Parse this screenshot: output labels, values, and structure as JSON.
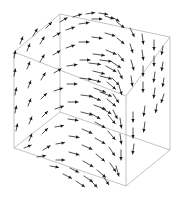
{
  "figure": {
    "title": "",
    "background_color": "#ffffff",
    "arrow_color": "#1a1a1a",
    "box_color": "#9a9a9a"
  },
  "chart_data": {
    "type": "scatter",
    "subtype": "quiver-3d-vector-field",
    "title": "",
    "subtitle": "",
    "xlabel": "",
    "ylabel": "",
    "zlabel": "",
    "grid": false,
    "legend": null,
    "legend_position": "none",
    "axis_ticks_visible": false,
    "tick_labels": [],
    "annotations": [],
    "xlim": [
      -1,
      1
    ],
    "ylim": [
      -1,
      1
    ],
    "zlim": [
      -1,
      1
    ],
    "field_description": "3D divergent (source-like) vector field; arrows radiate outward from a focus located right-of-center, sweeping around toward the box faces",
    "singularity_screen_xy": [
      126,
      96
    ],
    "grid_dims": [
      7,
      7,
      7
    ],
    "bounding_box_projection": {
      "front_top_left": [
        14,
        52
      ],
      "front_top_right": [
        126,
        96
      ],
      "front_bottom_left": [
        14,
        148
      ],
      "front_bottom_right": [
        126,
        186
      ],
      "back_top_left": [
        60,
        14
      ],
      "back_top_right": [
        170,
        37
      ],
      "back_bottom_left": [
        60,
        112
      ],
      "back_bottom_right": [
        170,
        150
      ]
    },
    "arrows": [
      {
        "x": 14,
        "y": 58,
        "dx": 1,
        "dy": -5
      },
      {
        "x": 14,
        "y": 76,
        "dx": 1,
        "dy": -5
      },
      {
        "x": 15,
        "y": 95,
        "dx": 1,
        "dy": -5
      },
      {
        "x": 15,
        "y": 113,
        "dx": 1,
        "dy": -5
      },
      {
        "x": 16,
        "y": 131,
        "dx": 1,
        "dy": -5
      },
      {
        "x": 27,
        "y": 51,
        "dx": 2,
        "dy": -5
      },
      {
        "x": 27,
        "y": 69,
        "dx": 2,
        "dy": -5
      },
      {
        "x": 28,
        "y": 88,
        "dx": 2,
        "dy": -5
      },
      {
        "x": 28,
        "y": 106,
        "dx": 2,
        "dy": -5
      },
      {
        "x": 29,
        "y": 124,
        "dx": 2,
        "dy": -5
      },
      {
        "x": 29,
        "y": 141,
        "dx": 2,
        "dy": -5
      },
      {
        "x": 40,
        "y": 44,
        "dx": 3,
        "dy": -5
      },
      {
        "x": 40,
        "y": 62,
        "dx": 3,
        "dy": -5
      },
      {
        "x": 41,
        "y": 80,
        "dx": 3,
        "dy": -5
      },
      {
        "x": 41,
        "y": 99,
        "dx": 4,
        "dy": -4
      },
      {
        "x": 42,
        "y": 117,
        "dx": 4,
        "dy": -4
      },
      {
        "x": 42,
        "y": 134,
        "dx": 4,
        "dy": -4
      },
      {
        "x": 43,
        "y": 150,
        "dx": 5,
        "dy": -3
      },
      {
        "x": 53,
        "y": 37,
        "dx": 5,
        "dy": -3
      },
      {
        "x": 53,
        "y": 55,
        "dx": 5,
        "dy": -3
      },
      {
        "x": 54,
        "y": 73,
        "dx": 5,
        "dy": -3
      },
      {
        "x": 54,
        "y": 91,
        "dx": 6,
        "dy": -2
      },
      {
        "x": 55,
        "y": 109,
        "dx": 6,
        "dy": -2
      },
      {
        "x": 55,
        "y": 127,
        "dx": 6,
        "dy": -1
      },
      {
        "x": 56,
        "y": 144,
        "dx": 6,
        "dy": -1
      },
      {
        "x": 56,
        "y": 160,
        "dx": 6,
        "dy": 0
      },
      {
        "x": 66,
        "y": 30,
        "dx": 6,
        "dy": -2
      },
      {
        "x": 66,
        "y": 48,
        "dx": 6,
        "dy": -2
      },
      {
        "x": 67,
        "y": 66,
        "dx": 7,
        "dy": -1
      },
      {
        "x": 67,
        "y": 84,
        "dx": 7,
        "dy": 0
      },
      {
        "x": 68,
        "y": 102,
        "dx": 7,
        "dy": 0
      },
      {
        "x": 68,
        "y": 119,
        "dx": 7,
        "dy": 1
      },
      {
        "x": 69,
        "y": 136,
        "dx": 7,
        "dy": 1
      },
      {
        "x": 69,
        "y": 152,
        "dx": 7,
        "dy": 2
      },
      {
        "x": 70,
        "y": 168,
        "dx": 6,
        "dy": 3
      },
      {
        "x": 79,
        "y": 24,
        "dx": 7,
        "dy": -1
      },
      {
        "x": 79,
        "y": 42,
        "dx": 7,
        "dy": 0
      },
      {
        "x": 80,
        "y": 60,
        "dx": 7,
        "dy": 0
      },
      {
        "x": 80,
        "y": 78,
        "dx": 8,
        "dy": 1
      },
      {
        "x": 81,
        "y": 95,
        "dx": 8,
        "dy": 1
      },
      {
        "x": 81,
        "y": 112,
        "dx": 8,
        "dy": 2
      },
      {
        "x": 82,
        "y": 129,
        "dx": 7,
        "dy": 3
      },
      {
        "x": 82,
        "y": 145,
        "dx": 7,
        "dy": 3
      },
      {
        "x": 83,
        "y": 161,
        "dx": 7,
        "dy": 4
      },
      {
        "x": 84,
        "y": 176,
        "dx": 6,
        "dy": 4
      },
      {
        "x": 92,
        "y": 19,
        "dx": 7,
        "dy": 0
      },
      {
        "x": 92,
        "y": 37,
        "dx": 7,
        "dy": 1
      },
      {
        "x": 93,
        "y": 54,
        "dx": 8,
        "dy": 1
      },
      {
        "x": 93,
        "y": 71,
        "dx": 8,
        "dy": 2
      },
      {
        "x": 94,
        "y": 88,
        "dx": 8,
        "dy": 3
      },
      {
        "x": 94,
        "y": 105,
        "dx": 8,
        "dy": 3
      },
      {
        "x": 95,
        "y": 122,
        "dx": 7,
        "dy": 4
      },
      {
        "x": 95,
        "y": 138,
        "dx": 7,
        "dy": 4
      },
      {
        "x": 96,
        "y": 154,
        "dx": 6,
        "dy": 5
      },
      {
        "x": 97,
        "y": 170,
        "dx": 6,
        "dy": 5
      },
      {
        "x": 105,
        "y": 16,
        "dx": 6,
        "dy": 2
      },
      {
        "x": 105,
        "y": 33,
        "dx": 7,
        "dy": 2
      },
      {
        "x": 106,
        "y": 50,
        "dx": 7,
        "dy": 3
      },
      {
        "x": 106,
        "y": 66,
        "dx": 7,
        "dy": 4
      },
      {
        "x": 107,
        "y": 82,
        "dx": 6,
        "dy": 5
      },
      {
        "x": 107,
        "y": 99,
        "dx": 6,
        "dy": 5
      },
      {
        "x": 108,
        "y": 115,
        "dx": 5,
        "dy": 6
      },
      {
        "x": 108,
        "y": 131,
        "dx": 5,
        "dy": 6
      },
      {
        "x": 109,
        "y": 147,
        "dx": 4,
        "dy": 6
      },
      {
        "x": 110,
        "y": 163,
        "dx": 4,
        "dy": 6
      },
      {
        "x": 117,
        "y": 22,
        "dx": 5,
        "dy": 4
      },
      {
        "x": 117,
        "y": 38,
        "dx": 5,
        "dy": 4
      },
      {
        "x": 118,
        "y": 54,
        "dx": 4,
        "dy": 5
      },
      {
        "x": 118,
        "y": 70,
        "dx": 3,
        "dy": 6
      },
      {
        "x": 119,
        "y": 86,
        "dx": 2,
        "dy": 6
      },
      {
        "x": 120,
        "y": 118,
        "dx": 1,
        "dy": 7
      },
      {
        "x": 120,
        "y": 134,
        "dx": 1,
        "dy": 7
      },
      {
        "x": 121,
        "y": 150,
        "dx": 0,
        "dy": 7
      },
      {
        "x": 130,
        "y": 28,
        "dx": 3,
        "dy": 6
      },
      {
        "x": 130,
        "y": 44,
        "dx": 2,
        "dy": 6
      },
      {
        "x": 131,
        "y": 60,
        "dx": 2,
        "dy": 7
      },
      {
        "x": 131,
        "y": 76,
        "dx": 1,
        "dy": 7
      },
      {
        "x": 133,
        "y": 112,
        "dx": 0,
        "dy": 7
      },
      {
        "x": 133,
        "y": 128,
        "dx": 0,
        "dy": 7
      },
      {
        "x": 134,
        "y": 144,
        "dx": -1,
        "dy": 7
      },
      {
        "x": 142,
        "y": 34,
        "dx": 1,
        "dy": 7
      },
      {
        "x": 142,
        "y": 50,
        "dx": 1,
        "dy": 7
      },
      {
        "x": 143,
        "y": 66,
        "dx": 0,
        "dy": 7
      },
      {
        "x": 143,
        "y": 82,
        "dx": 0,
        "dy": 7
      },
      {
        "x": 145,
        "y": 106,
        "dx": -1,
        "dy": 7
      },
      {
        "x": 145,
        "y": 122,
        "dx": -1,
        "dy": 7
      },
      {
        "x": 154,
        "y": 40,
        "dx": 0,
        "dy": 7
      },
      {
        "x": 154,
        "y": 56,
        "dx": 0,
        "dy": 7
      },
      {
        "x": 155,
        "y": 72,
        "dx": -1,
        "dy": 7
      },
      {
        "x": 155,
        "y": 88,
        "dx": -1,
        "dy": 7
      },
      {
        "x": 157,
        "y": 104,
        "dx": -1,
        "dy": 6
      },
      {
        "x": 163,
        "y": 46,
        "dx": -1,
        "dy": 6
      },
      {
        "x": 163,
        "y": 62,
        "dx": -1,
        "dy": 6
      },
      {
        "x": 164,
        "y": 78,
        "dx": -1,
        "dy": 6
      },
      {
        "x": 164,
        "y": 94,
        "dx": -2,
        "dy": 6
      },
      {
        "x": 46,
        "y": 28,
        "dx": 4,
        "dy": -4
      },
      {
        "x": 60,
        "y": 22,
        "dx": 5,
        "dy": -3
      },
      {
        "x": 73,
        "y": 17,
        "dx": 6,
        "dy": -2
      },
      {
        "x": 86,
        "y": 14,
        "dx": 6,
        "dy": -1
      },
      {
        "x": 99,
        "y": 13,
        "dx": 6,
        "dy": 1
      },
      {
        "x": 112,
        "y": 17,
        "dx": 5,
        "dy": 3
      },
      {
        "x": 33,
        "y": 36,
        "dx": 3,
        "dy": -5
      },
      {
        "x": 20,
        "y": 44,
        "dx": 2,
        "dy": -5
      },
      {
        "x": 24,
        "y": 148,
        "dx": 5,
        "dy": -2
      },
      {
        "x": 37,
        "y": 157,
        "dx": 6,
        "dy": -1
      },
      {
        "x": 50,
        "y": 166,
        "dx": 6,
        "dy": 1
      },
      {
        "x": 63,
        "y": 174,
        "dx": 6,
        "dy": 3
      },
      {
        "x": 76,
        "y": 181,
        "dx": 6,
        "dy": 4
      },
      {
        "x": 90,
        "y": 180,
        "dx": 5,
        "dy": 5
      },
      {
        "x": 103,
        "y": 176,
        "dx": 4,
        "dy": 6
      },
      {
        "x": 116,
        "y": 166,
        "dx": 2,
        "dy": 7
      },
      {
        "x": 100,
        "y": 60,
        "dx": 8,
        "dy": 1
      },
      {
        "x": 100,
        "y": 76,
        "dx": 8,
        "dy": 2
      },
      {
        "x": 100,
        "y": 92,
        "dx": 8,
        "dy": 3
      },
      {
        "x": 101,
        "y": 108,
        "dx": 7,
        "dy": 4
      },
      {
        "x": 112,
        "y": 62,
        "dx": 6,
        "dy": 4
      },
      {
        "x": 112,
        "y": 78,
        "dx": 5,
        "dy": 5
      },
      {
        "x": 113,
        "y": 94,
        "dx": 4,
        "dy": 6
      },
      {
        "x": 113,
        "y": 110,
        "dx": 3,
        "dy": 6
      },
      {
        "x": 89,
        "y": 63,
        "dx": 8,
        "dy": 1
      },
      {
        "x": 89,
        "y": 79,
        "dx": 8,
        "dy": 2
      },
      {
        "x": 89,
        "y": 96,
        "dx": 8,
        "dy": 3
      },
      {
        "x": 90,
        "y": 113,
        "dx": 7,
        "dy": 4
      }
    ]
  }
}
